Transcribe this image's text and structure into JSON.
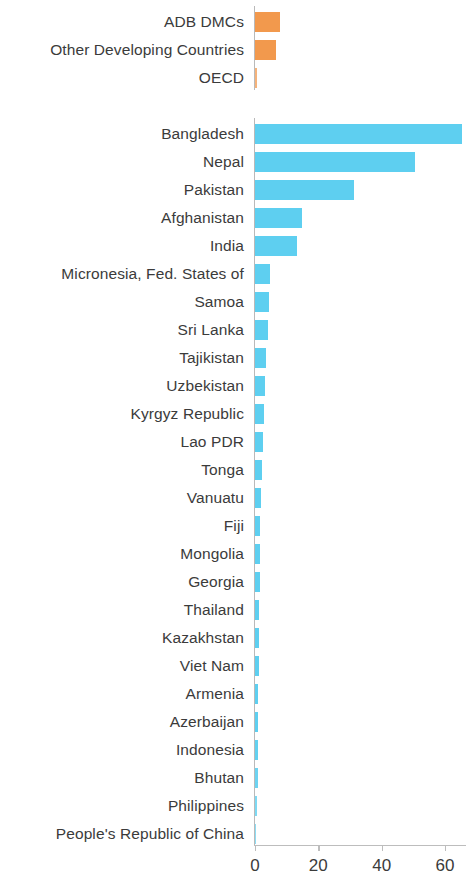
{
  "chart_data": {
    "type": "bar",
    "orientation": "horizontal",
    "title": "",
    "subtitle": "",
    "xlabel": "",
    "ylabel": "",
    "xlim": [
      0,
      66.5
    ],
    "grid": false,
    "legend": "none",
    "axis_ticks": [
      {
        "label": "0",
        "value": 0
      },
      {
        "label": "20",
        "value": 20
      },
      {
        "label": "40",
        "value": 40
      },
      {
        "label": "60",
        "value": 60
      }
    ],
    "colors": {
      "group_aggregate": "#F2994D",
      "group_country": "#5ECFF0",
      "axis": "#bdbdbd",
      "label_text": "#3b3b3b"
    },
    "groups": [
      {
        "name": "aggregates",
        "color": "#F2994D",
        "categories": [
          "ADB DMCs",
          "Other Developing Countries",
          "OECD"
        ],
        "values": [
          7.9,
          6.6,
          0.5
        ]
      },
      {
        "name": "countries",
        "color": "#5ECFF0",
        "categories": [
          "Bangladesh",
          "Nepal",
          "Pakistan",
          "Afghanistan",
          "India",
          "Micronesia, Fed. States of",
          "Samoa",
          "Sri Lanka",
          "Tajikistan",
          "Uzbekistan",
          "Kyrgyz Republic",
          "Lao PDR",
          "Tonga",
          "Vanuatu",
          "Fiji",
          "Mongolia",
          "Georgia",
          "Thailand",
          "Kazakhstan",
          "Viet Nam",
          "Armenia",
          "Azerbaijan",
          "Indonesia",
          "Bhutan",
          "Philippines",
          "People's Republic of China"
        ],
        "values": [
          65.3,
          50.6,
          31.4,
          14.7,
          13.4,
          4.6,
          4.3,
          4.0,
          3.6,
          3.2,
          2.7,
          2.4,
          2.1,
          1.9,
          1.7,
          1.6,
          1.5,
          1.4,
          1.3,
          1.2,
          1.1,
          1.0,
          0.9,
          0.8,
          0.6,
          0.4
        ]
      }
    ]
  }
}
